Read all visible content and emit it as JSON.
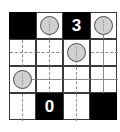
{
  "puzzle": {
    "type": "light-up",
    "rows": 4,
    "cols": 4,
    "colors": {
      "black_cell": "#000000",
      "white_cell": "#ffffff",
      "clue_text": "#ffffff",
      "bulb_fill": "#d0d0d0",
      "bulb_outline": "#4a4a4a",
      "beam": "#8c8c8c",
      "grid_line": "#3a3a3a"
    },
    "cells": [
      [
        {
          "type": "black",
          "clue": ""
        },
        {
          "type": "white",
          "bulb": true
        },
        {
          "type": "black",
          "clue": "3"
        },
        {
          "type": "white",
          "bulb": true
        }
      ],
      [
        {
          "type": "white",
          "bulb": false
        },
        {
          "type": "white",
          "bulb": false
        },
        {
          "type": "white",
          "bulb": true
        },
        {
          "type": "white",
          "bulb": false
        }
      ],
      [
        {
          "type": "white",
          "bulb": true
        },
        {
          "type": "white",
          "bulb": false
        },
        {
          "type": "white",
          "bulb": false
        },
        {
          "type": "white",
          "bulb": false
        }
      ],
      [
        {
          "type": "white",
          "bulb": false
        },
        {
          "type": "black",
          "clue": "0"
        },
        {
          "type": "white",
          "bulb": false
        },
        {
          "type": "black",
          "clue": ""
        }
      ]
    ],
    "clues": {
      "r0c2": "3",
      "r3c1": "0"
    }
  }
}
